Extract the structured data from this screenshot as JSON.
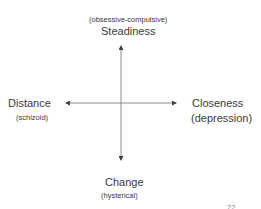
{
  "diagram": {
    "top": {
      "label": "Steadiness",
      "sublabel": "(obsessive-compulsive)"
    },
    "left": {
      "label": "Distance",
      "sublabel": "(schizoid)"
    },
    "right": {
      "label": "Closeness",
      "sublabel": "(depression)"
    },
    "bottom": {
      "label": "Change",
      "sublabel": "(hysterical)"
    },
    "slide_number": "22",
    "axis_color": "#7f7f7f",
    "text_color": "#3a3a3a"
  }
}
